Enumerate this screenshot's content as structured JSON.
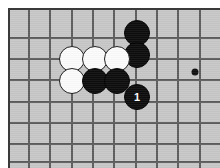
{
  "diagram": {
    "kind": "go-board-diagram",
    "game": "Go",
    "board_color": "#c7c7c7",
    "line_color": "#5d5d5d",
    "frame_color": "#3a3a3a",
    "black_color": "#0d0d0d",
    "white_color": "#fbfbfb",
    "page_background": "#ffffff",
    "grid": {
      "spacing_px": 21.3,
      "origin_x_px": 27,
      "origin_y_px": 36,
      "vertical_lines_px": [
        27,
        48,
        70,
        91,
        112,
        134,
        155,
        176,
        198
      ],
      "horizontal_lines_px": [
        36,
        57,
        78,
        100,
        121,
        142,
        160
      ],
      "cols_visible": 9,
      "rows_visible": 7
    },
    "star_points": [
      {
        "name": "hoshi-right",
        "x": 193,
        "y": 70,
        "radius": 3.5
      }
    ],
    "stones": [
      {
        "id": "b-top-cut",
        "color": "black",
        "x": 135,
        "y": 31,
        "radius": 13,
        "label": ""
      },
      {
        "id": "b-r1c4",
        "color": "black",
        "x": 135,
        "y": 53,
        "radius": 13,
        "label": ""
      },
      {
        "id": "w-r1c1",
        "color": "white",
        "x": 70,
        "y": 57,
        "radius": 13,
        "label": ""
      },
      {
        "id": "w-r1c2",
        "color": "white",
        "x": 93,
        "y": 57,
        "radius": 13,
        "label": ""
      },
      {
        "id": "w-r1c3",
        "color": "white",
        "x": 115,
        "y": 57,
        "radius": 13,
        "label": ""
      },
      {
        "id": "w-r2c1",
        "color": "white",
        "x": 70,
        "y": 79,
        "radius": 13,
        "label": ""
      },
      {
        "id": "b-r2c2",
        "color": "black",
        "x": 93,
        "y": 79,
        "radius": 13,
        "label": ""
      },
      {
        "id": "b-r2c3",
        "color": "black",
        "x": 115,
        "y": 79,
        "radius": 13,
        "label": ""
      },
      {
        "id": "b-move-1",
        "color": "black",
        "x": 135,
        "y": 95,
        "radius": 13,
        "label": "1"
      }
    ],
    "move_numbers": [
      "1"
    ],
    "black_stone_count": 4,
    "white_stone_count": 4,
    "marked_move_label": "1"
  }
}
